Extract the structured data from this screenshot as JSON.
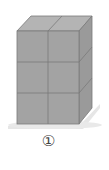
{
  "figure": {
    "label": "①",
    "grid": {
      "columns": 2,
      "rows": 3,
      "depth": 1
    },
    "colors": {
      "front": "#a3a3a3",
      "top": "#b4b4b4",
      "right": "#9a9a9a",
      "edge": "#7a7a7a",
      "shadow": "#e6e6e6",
      "label": "#444444"
    }
  }
}
